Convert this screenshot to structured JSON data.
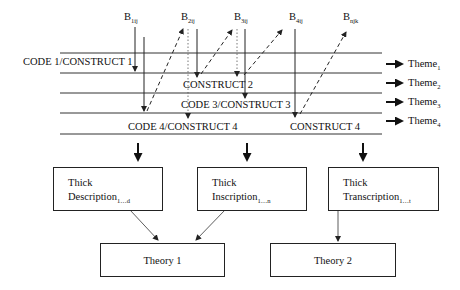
{
  "diagram": {
    "top_labels": [
      {
        "base": "B",
        "sub": "1ij"
      },
      {
        "base": "B",
        "sub": "2ij"
      },
      {
        "base": "B",
        "sub": "3ij"
      },
      {
        "base": "B",
        "sub": "4ij"
      },
      {
        "base": "B",
        "sub": "njk"
      }
    ],
    "rows": [
      {
        "label": "CODE 1/CONSTRUCT 1"
      },
      {
        "label": "CONSTRUCT 2"
      },
      {
        "label": "CODE 3/CONSTRUCT 3"
      },
      {
        "label": "CODE 4/CONSTRUCT 4"
      },
      {
        "label": "CONSTRUCT 4"
      }
    ],
    "themes": [
      {
        "base": "Theme",
        "sub": "1"
      },
      {
        "base": "Theme",
        "sub": "2"
      },
      {
        "base": "Theme",
        "sub": "3"
      },
      {
        "base": "Theme",
        "sub": "4"
      }
    ],
    "thick_boxes": [
      {
        "line1": "Thick",
        "line2": "Description",
        "sub": "1…d"
      },
      {
        "line1": "Thick",
        "line2": "Inscription",
        "sub": "1…n"
      },
      {
        "line1": "Thick",
        "line2": "Transcription",
        "sub": "1…t"
      }
    ],
    "theories": [
      {
        "label": "Theory 1"
      },
      {
        "label": "Theory 2"
      }
    ],
    "colors": {
      "line": "#222222",
      "background": "#ffffff"
    }
  }
}
